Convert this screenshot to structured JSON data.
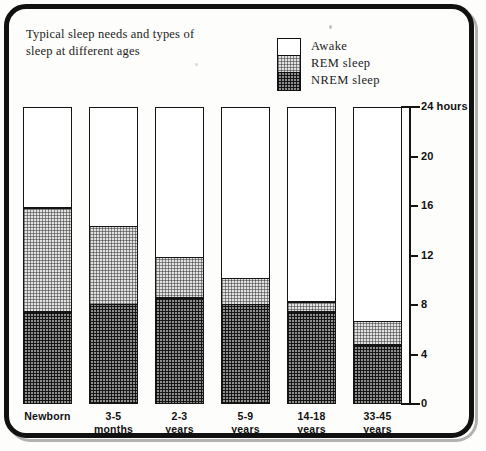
{
  "chart_data": {
    "type": "bar",
    "subtype": "stacked-bar",
    "title": "Typical sleep needs and types of sleep at different ages",
    "xlabel": "",
    "ylabel": "24 hours",
    "ylim": [
      0,
      24
    ],
    "yticks": [
      0,
      4,
      8,
      12,
      16,
      20,
      24
    ],
    "ytick_labels": [
      "0",
      "4",
      "8",
      "12",
      "16",
      "20",
      "24 hours"
    ],
    "grid": false,
    "legend_position": "top-right",
    "categories": [
      "Newborn",
      "3-5 months",
      "2-3 years",
      "5-9 years",
      "14-18 years",
      "33-45 years"
    ],
    "series": [
      {
        "name": "NREM sleep",
        "values": [
          7.6,
          8.2,
          8.7,
          8.2,
          7.6,
          4.9
        ]
      },
      {
        "name": "REM sleep",
        "values": [
          8.4,
          6.3,
          3.3,
          2.1,
          0.8,
          1.9
        ]
      },
      {
        "name": "Awake",
        "values": [
          8.0,
          9.5,
          12.0,
          13.7,
          15.6,
          17.2
        ]
      }
    ],
    "stack_order": [
      "NREM sleep",
      "REM sleep",
      "Awake"
    ],
    "units": "hours per 24-hour day"
  },
  "title": {
    "line1": "Typical sleep needs and types of",
    "line2": "sleep at different ages"
  },
  "legend": {
    "items": [
      {
        "label": "Awake",
        "swatch": "white"
      },
      {
        "label": "REM sleep",
        "swatch": "light-stipple"
      },
      {
        "label": "NREM sleep",
        "swatch": "dark-stipple"
      }
    ]
  },
  "axis": {
    "ticks": [
      {
        "value": 24,
        "label": "24 hours"
      },
      {
        "value": 20,
        "label": "20"
      },
      {
        "value": 16,
        "label": "16"
      },
      {
        "value": 12,
        "label": "12"
      },
      {
        "value": 8,
        "label": "8"
      },
      {
        "value": 4,
        "label": "4"
      },
      {
        "value": 0,
        "label": "0"
      }
    ]
  },
  "bars": [
    {
      "name": "Newborn",
      "label_line1": "Newborn",
      "label_line2": "",
      "nrem": 7.6,
      "rem": 8.4,
      "awake": 8.0
    },
    {
      "name": "3-5 months",
      "label_line1": "3-5",
      "label_line2": "months",
      "nrem": 8.2,
      "rem": 6.3,
      "awake": 9.5
    },
    {
      "name": "2-3 years",
      "label_line1": "2-3",
      "label_line2": "years",
      "nrem": 8.7,
      "rem": 3.3,
      "awake": 12.0
    },
    {
      "name": "5-9 years",
      "label_line1": "5-9",
      "label_line2": "years",
      "nrem": 8.2,
      "rem": 2.1,
      "awake": 13.7
    },
    {
      "name": "14-18 years",
      "label_line1": "14-18",
      "label_line2": "years",
      "nrem": 7.6,
      "rem": 0.8,
      "awake": 15.6
    },
    {
      "name": "33-45 years",
      "label_line1": "33-45",
      "label_line2": "years",
      "nrem": 4.9,
      "rem": 1.9,
      "awake": 17.2
    }
  ],
  "colors": {
    "awake": "#ffffff",
    "rem": "#e2e2e2",
    "nrem": "#8e8e8e",
    "ink": "#141414"
  }
}
